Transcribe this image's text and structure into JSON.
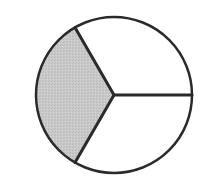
{
  "diagram": {
    "type": "fraction-circle",
    "total_parts": 3,
    "shaded_parts": 1,
    "fraction": "1/3",
    "center": [
      114,
      95
    ],
    "radius": 78,
    "sectors": [
      {
        "name": "left",
        "start_deg": 120,
        "end_deg": 240,
        "shaded": true,
        "fill": "#c8c8c8"
      },
      {
        "name": "upper-right",
        "start_deg": 0,
        "end_deg": 120,
        "shaded": false,
        "fill": "#ffffff"
      },
      {
        "name": "lower-right",
        "start_deg": 240,
        "end_deg": 360,
        "shaded": false,
        "fill": "#ffffff"
      }
    ],
    "stroke_color": "#2a2a2a"
  }
}
